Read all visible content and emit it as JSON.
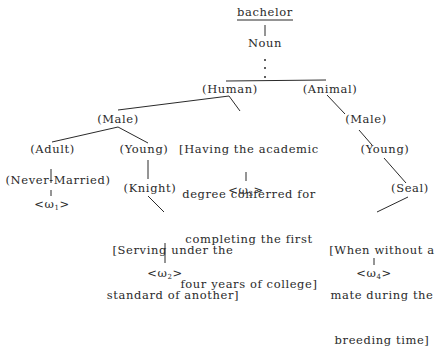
{
  "root": {
    "word": "bachelor",
    "pos": "Noun"
  },
  "nodes": {
    "human": "(Human)",
    "animal": "(Animal)",
    "male_h": "(Male)",
    "adult": "(Adult)",
    "young_h": "(Young)",
    "never_married": "(Never-Married)",
    "knight": "(Knight)",
    "male_a": "(Male)",
    "young_a": "(Young)",
    "seal": "(Seal)"
  },
  "distinguishers": {
    "d2": [
      "[Serving under the",
      "standard of another]"
    ],
    "d3": [
      "[Having the academic",
      "degree conferred for",
      "completing the first",
      "four years of college]"
    ],
    "d4": [
      "[When without a",
      "mate during the",
      "breeding time]"
    ]
  },
  "readings": {
    "w1": {
      "open": "<ω",
      "sub": "1",
      "close": ">"
    },
    "w2": {
      "open": "<ω",
      "sub": "2",
      "close": ">"
    },
    "w3": {
      "open": "<ω",
      "sub": "3",
      "close": ">"
    },
    "w4": {
      "open": "<ω",
      "sub": "4",
      "close": ">"
    }
  }
}
